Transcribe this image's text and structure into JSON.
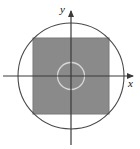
{
  "figure": {
    "background_color": "#ffffff",
    "width": 140,
    "height": 149
  },
  "axes": {
    "x_label": "x",
    "y_label": "y",
    "origin": {
      "x": 71,
      "y": 76
    },
    "line_color": "#3a3a3a",
    "x_axis": {
      "start_x": 3,
      "end_x": 137,
      "y": 76,
      "arrow": "right"
    },
    "y_axis": {
      "x": 71,
      "start_y": 145,
      "end_y": 6,
      "arrow": "up"
    }
  },
  "shapes": {
    "outer_circle": {
      "name": "outer-circle",
      "center_x": 71,
      "center_y": 76,
      "radius": 53,
      "stroke_color": "#4a4a4a",
      "fill": "none"
    },
    "inner_circle": {
      "name": "inner-circle",
      "center_x": 71,
      "center_y": 76,
      "radius": 13.5,
      "stroke_color": "#d8d8d8",
      "fill": "none"
    },
    "square": {
      "name": "shaded-square",
      "x": 33,
      "y": 38,
      "width": 76,
      "height": 76,
      "fill_color": "#8a8a8a",
      "stroke_color": "#7a7a7a"
    }
  }
}
